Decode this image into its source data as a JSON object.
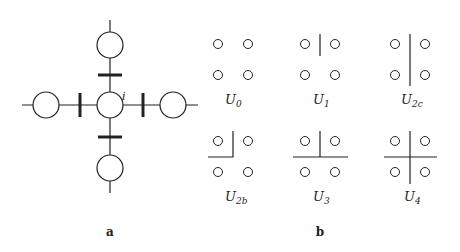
{
  "figure": {
    "panel_a": {
      "label": "a",
      "center_node_label": "i",
      "nodes": [
        {
          "name": "center",
          "cx": 110,
          "cy": 105
        },
        {
          "name": "top",
          "cx": 110,
          "cy": 45
        },
        {
          "name": "bottom",
          "cx": 110,
          "cy": 168
        },
        {
          "name": "left",
          "cx": 46,
          "cy": 105
        },
        {
          "name": "right",
          "cx": 173,
          "cy": 105
        }
      ],
      "node_radius": 13
    },
    "panel_b": {
      "label": "b",
      "configs": [
        {
          "id": "U0",
          "base": "U",
          "sub": "0"
        },
        {
          "id": "U1",
          "base": "U",
          "sub": "1"
        },
        {
          "id": "U2c",
          "base": "U",
          "sub": "2c"
        },
        {
          "id": "U2b",
          "base": "U",
          "sub": "2b"
        },
        {
          "id": "U3",
          "base": "U",
          "sub": "3"
        },
        {
          "id": "U4",
          "base": "U",
          "sub": "4"
        }
      ]
    },
    "colors": {
      "stroke": "#222222",
      "background": "#ffffff"
    }
  }
}
